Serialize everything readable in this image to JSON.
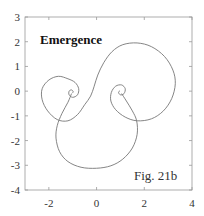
{
  "chart_data": {
    "type": "line",
    "title": "Emergence",
    "annotation": "Fig. 21b",
    "xlabel": "",
    "ylabel": "",
    "xlim": [
      -3,
      4
    ],
    "ylim": [
      -4,
      3
    ],
    "grid": false,
    "legend": null,
    "x_ticks": [
      -2,
      0,
      2,
      4
    ],
    "x_tick_labels": [
      "-2",
      "0",
      "2",
      "4"
    ],
    "y_ticks": [
      3,
      2,
      1,
      0,
      -1,
      -2,
      -3,
      -4
    ],
    "y_tick_labels": [
      "3",
      "2",
      "1",
      "0",
      "-1",
      "-2",
      "-3",
      "-4"
    ],
    "line_color": "#777777",
    "series": [
      {
        "name": "curve",
        "description": "Double spiral (clothoid-like) curve with curls near (-1.05,-0.05) and (1.0,-0.05)",
        "points": [
          [
            -1.02,
            -0.08
          ],
          [
            -0.98,
            -0.02
          ],
          [
            -1.05,
            0.05
          ],
          [
            -1.15,
            0.0
          ],
          [
            -1.15,
            -0.15
          ],
          [
            -1.0,
            -0.25
          ],
          [
            -0.8,
            -0.15
          ],
          [
            -0.75,
            0.1
          ],
          [
            -0.9,
            0.35
          ],
          [
            -1.2,
            0.5
          ],
          [
            -1.6,
            0.6
          ],
          [
            -2.0,
            0.45
          ],
          [
            -2.28,
            0.1
          ],
          [
            -2.28,
            -0.35
          ],
          [
            -2.05,
            -0.8
          ],
          [
            -1.65,
            -1.15
          ],
          [
            -1.2,
            -1.2
          ],
          [
            -0.8,
            -0.95
          ],
          [
            -0.5,
            -0.55
          ],
          [
            -0.25,
            -0.2
          ],
          [
            -0.1,
            0.2
          ],
          [
            0.05,
            0.65
          ],
          [
            0.3,
            1.15
          ],
          [
            0.65,
            1.6
          ],
          [
            1.1,
            1.88
          ],
          [
            1.7,
            1.95
          ],
          [
            2.3,
            1.8
          ],
          [
            2.85,
            1.4
          ],
          [
            3.2,
            0.85
          ],
          [
            3.3,
            0.3
          ],
          [
            3.15,
            -0.3
          ],
          [
            2.8,
            -0.8
          ],
          [
            2.3,
            -1.12
          ],
          [
            1.7,
            -1.2
          ],
          [
            1.2,
            -1.05
          ],
          [
            0.8,
            -0.75
          ],
          [
            0.6,
            -0.4
          ],
          [
            0.62,
            -0.05
          ],
          [
            0.8,
            0.2
          ],
          [
            1.05,
            0.25
          ],
          [
            1.2,
            0.1
          ],
          [
            1.15,
            -0.1
          ],
          [
            1.0,
            -0.15
          ],
          [
            0.92,
            -0.05
          ],
          [
            0.98,
            0.02
          ]
        ]
      },
      {
        "name": "lower-loop",
        "description": "Large lower loop joining the two curls",
        "points": [
          [
            -1.05,
            -0.1
          ],
          [
            -1.2,
            -0.45
          ],
          [
            -1.45,
            -0.9
          ],
          [
            -1.65,
            -1.4
          ],
          [
            -1.7,
            -1.9
          ],
          [
            -1.55,
            -2.45
          ],
          [
            -1.2,
            -2.85
          ],
          [
            -0.65,
            -3.08
          ],
          [
            0.0,
            -3.12
          ],
          [
            0.6,
            -3.02
          ],
          [
            1.1,
            -2.75
          ],
          [
            1.5,
            -2.3
          ],
          [
            1.7,
            -1.75
          ],
          [
            1.68,
            -1.2
          ],
          [
            1.5,
            -0.8
          ],
          [
            1.25,
            -0.4
          ],
          [
            1.05,
            -0.1
          ]
        ]
      }
    ]
  }
}
